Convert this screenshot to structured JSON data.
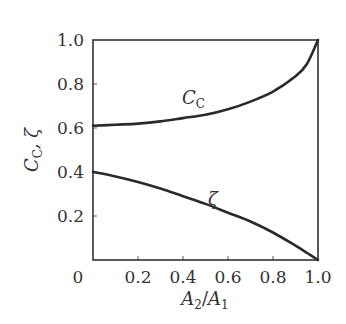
{
  "chart_data": {
    "type": "line",
    "title": "",
    "xlabel": "A2/A1",
    "ylabel": "C_C, ζ",
    "xlim": [
      0,
      1.0
    ],
    "ylim": [
      0,
      1.0
    ],
    "grid": false,
    "legend": "none (inline curve labels)",
    "x_ticks": [
      "0",
      "0.2",
      "0.4",
      "0.6",
      "0.8",
      "1.0"
    ],
    "y_ticks": [
      "0.2",
      "0.4",
      "0.6",
      "0.8",
      "1.0"
    ],
    "x": [
      0.0,
      0.1,
      0.2,
      0.3,
      0.4,
      0.5,
      0.6,
      0.7,
      0.8,
      0.9,
      0.95,
      1.0
    ],
    "series": [
      {
        "name": "C_C",
        "label": "C",
        "label_sub": "C",
        "values": [
          0.61,
          0.615,
          0.62,
          0.63,
          0.645,
          0.66,
          0.685,
          0.72,
          0.765,
          0.835,
          0.89,
          1.0
        ]
      },
      {
        "name": "ζ",
        "label": "ζ",
        "values": [
          0.4,
          0.38,
          0.355,
          0.325,
          0.29,
          0.255,
          0.215,
          0.175,
          0.125,
          0.065,
          0.033,
          0.0
        ]
      }
    ]
  },
  "labels": {
    "x_axis": {
      "main": "A",
      "sub1": "2",
      "slash": "/",
      "main2": "A",
      "sub2": "1"
    },
    "y_axis": {
      "c": "C",
      "csub": "C",
      "rest": ", ζ"
    },
    "curve_cc": {
      "main": "C",
      "sub": "C"
    },
    "curve_zeta": "ζ"
  }
}
